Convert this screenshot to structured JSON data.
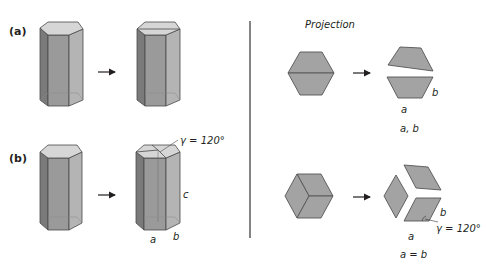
{
  "panel_labels": {
    "a": "(a)",
    "b": "(b)"
  },
  "projection_title": "Projection",
  "labels": {
    "gamma_prism": "γ = 120°",
    "c": "c",
    "a_prism": "a",
    "b_prism": "b",
    "b_top_proj": "b",
    "a_top_proj": "a",
    "caption_top": "a, b",
    "b_bottom_proj": "b",
    "gamma_bottom_proj": "γ = 120°",
    "a_bottom_proj": "a",
    "caption_bottom": "a = b"
  },
  "colors": {
    "face_dark": "#7a7a7a",
    "face_mid": "#9a9a9a",
    "face_light": "#b4b4b4",
    "face_top": "#d6d6d6",
    "projection_fill": "#a3a3a3",
    "outline": "#4a4a4a",
    "text": "#231f20",
    "separator": "#333333"
  }
}
